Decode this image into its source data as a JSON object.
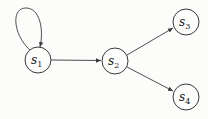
{
  "diagram": {
    "type": "state-transition-graph",
    "nodes": [
      {
        "id": "s1",
        "base": "s",
        "sub": "1",
        "x": 38,
        "y": 60
      },
      {
        "id": "s2",
        "base": "s",
        "sub": "2",
        "x": 115,
        "y": 61
      },
      {
        "id": "s3",
        "base": "s",
        "sub": "3",
        "x": 186,
        "y": 22
      },
      {
        "id": "s4",
        "base": "s",
        "sub": "4",
        "x": 186,
        "y": 97
      }
    ],
    "edges": [
      {
        "from": "s1",
        "to": "s1",
        "kind": "self-loop"
      },
      {
        "from": "s1",
        "to": "s2"
      },
      {
        "from": "s2",
        "to": "s3"
      },
      {
        "from": "s2",
        "to": "s4"
      }
    ],
    "colors": {
      "stroke": "#3a3a3a",
      "background": "#fcfcfb"
    }
  }
}
